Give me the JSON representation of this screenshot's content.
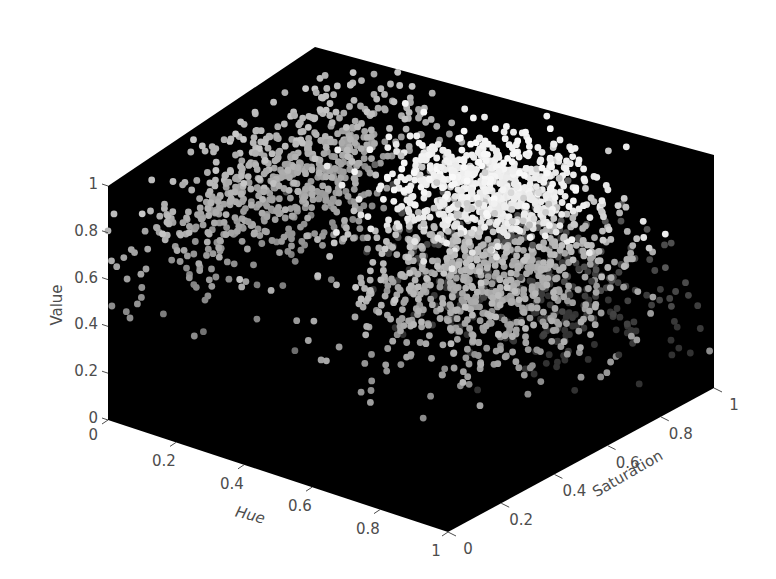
{
  "figure": {
    "background": "#ffffff",
    "axes_background": "#000000",
    "text_color": "#4d4d4d"
  },
  "chart_data": {
    "type": "scatter3d",
    "title": "",
    "xlabel": "Hue",
    "ylabel": "Saturation",
    "zlabel": "Value",
    "xlim": [
      0,
      1
    ],
    "ylim": [
      0,
      1
    ],
    "zlim": [
      0,
      1
    ],
    "xticks": [
      "0",
      "0.2",
      "0.4",
      "0.6",
      "0.8",
      "1"
    ],
    "yticks": [
      "0",
      "0.2",
      "0.4",
      "0.6",
      "0.8",
      "1"
    ],
    "zticks": [
      "0",
      "0.2",
      "0.4",
      "0.6",
      "0.8",
      "1"
    ],
    "grid": false,
    "legend": null,
    "marker": "filled circle, grayscale color by point",
    "clusters": [
      {
        "name": "low-hue cluster",
        "hue_center": 0.08,
        "sat_center": 0.55,
        "value_center": 0.72,
        "spread": [
          0.1,
          0.25,
          0.14
        ],
        "gray": [
          110,
          200
        ],
        "count": 700
      },
      {
        "name": "bright central cluster",
        "hue_center": 0.55,
        "sat_center": 0.72,
        "value_center": 0.82,
        "spread": [
          0.12,
          0.12,
          0.08
        ],
        "gray": [
          200,
          250
        ],
        "count": 650
      },
      {
        "name": "mid cluster",
        "hue_center": 0.65,
        "sat_center": 0.6,
        "value_center": 0.55,
        "spread": [
          0.15,
          0.18,
          0.15
        ],
        "gray": [
          140,
          220
        ],
        "count": 800
      },
      {
        "name": "faint spread",
        "hue_center": 0.6,
        "sat_center": 0.85,
        "value_center": 0.35,
        "spread": [
          0.2,
          0.12,
          0.15
        ],
        "gray": [
          50,
          120
        ],
        "count": 300
      }
    ]
  }
}
